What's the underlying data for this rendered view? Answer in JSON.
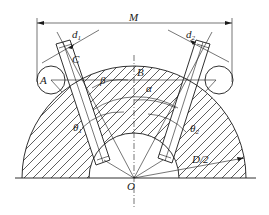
{
  "figure": {
    "type": "engineering-diagram",
    "labels": {
      "M": "M",
      "d1": "d",
      "d1_sub": "1",
      "d2": "d",
      "d2_sub": "2",
      "A": "A",
      "B": "B",
      "C": "C",
      "beta": "β",
      "alpha": "α",
      "theta1": "θ",
      "theta1_sub": "1",
      "theta2": "θ",
      "theta2_sub": "2",
      "radius": "D/2",
      "origin": "O"
    },
    "colors": {
      "line": "#1a1a1a",
      "background": "#ffffff"
    }
  }
}
